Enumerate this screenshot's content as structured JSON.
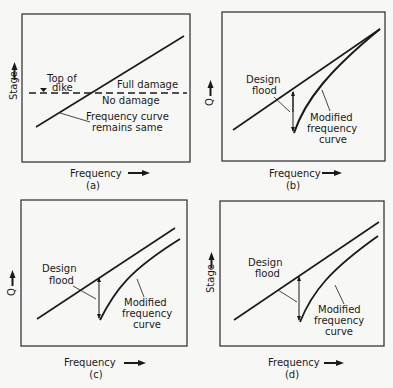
{
  "panels": {
    "a": {
      "caption": "(a)",
      "xlabel": "Frequency",
      "ylabel": "Stage",
      "annotations": {
        "top_of_dike_1": "Top of",
        "top_of_dike_2": "dike",
        "full_damage": "Full damage",
        "no_damage": "No damage",
        "curve_note_1": "Frequency curve",
        "curve_note_2": "remains same"
      }
    },
    "b": {
      "caption": "(b)",
      "xlabel": "Frequency",
      "ylabel": "Q",
      "annotations": {
        "design_flood_1": "Design",
        "design_flood_2": "flood",
        "modified_1": "Modified",
        "modified_2": "frequency",
        "modified_3": "curve"
      }
    },
    "c": {
      "caption": "(c)",
      "xlabel": "Frequency",
      "ylabel": "Q",
      "annotations": {
        "design_flood_1": "Design",
        "design_flood_2": "flood",
        "modified_1": "Modified",
        "modified_2": "frequency",
        "modified_3": "curve"
      }
    },
    "d": {
      "caption": "(d)",
      "xlabel": "Frequency",
      "ylabel": "Stage",
      "annotations": {
        "design_flood_1": "Design",
        "design_flood_2": "flood",
        "modified_1": "Modified",
        "modified_2": "frequency",
        "modified_3": "curve"
      }
    }
  },
  "colors": {
    "ink": "#1a1a1a",
    "frame": "#3a3a3a",
    "background": "#f7f7f5"
  }
}
